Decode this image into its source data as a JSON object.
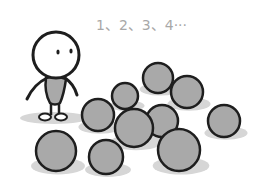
{
  "illustration": {
    "caption": "1、2、3、4···",
    "colors": {
      "background": "#ffffff",
      "ball_fill": "#a9a9a9",
      "outline": "#1e1e1e",
      "shadow": "#d6d6d6",
      "text": "#a8a8a8",
      "body_fill": "#a9a9a9"
    },
    "figure": {
      "head": {
        "cx": 56,
        "cy": 58,
        "r": 23
      },
      "eyes": [
        {
          "cx": 57,
          "cy": 51
        },
        {
          "cx": 71,
          "cy": 50
        }
      ]
    },
    "balls": [
      {
        "cx": 158,
        "cy": 78,
        "r": 15
      },
      {
        "cx": 187,
        "cy": 92,
        "r": 16
      },
      {
        "cx": 125,
        "cy": 96,
        "r": 13
      },
      {
        "cx": 98,
        "cy": 115,
        "r": 16
      },
      {
        "cx": 162,
        "cy": 121,
        "r": 16
      },
      {
        "cx": 134,
        "cy": 128,
        "r": 19
      },
      {
        "cx": 224,
        "cy": 121,
        "r": 16
      },
      {
        "cx": 56,
        "cy": 151,
        "r": 20
      },
      {
        "cx": 106,
        "cy": 157,
        "r": 17
      },
      {
        "cx": 179,
        "cy": 150,
        "r": 21
      }
    ]
  }
}
